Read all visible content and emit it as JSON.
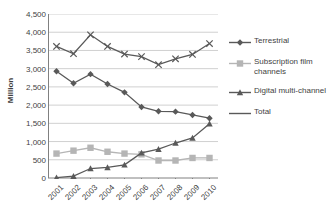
{
  "chart_data": {
    "type": "line",
    "title": "",
    "xlabel": "",
    "ylabel": "Million",
    "x": [
      "2001",
      "2002",
      "2003",
      "2004",
      "2005",
      "2006",
      "2007",
      "2008",
      "2009",
      "2010"
    ],
    "categories": [
      "2001",
      "2002",
      "2003",
      "2004",
      "2005",
      "2006",
      "2007",
      "2008",
      "2009",
      "2010"
    ],
    "ylim": [
      0,
      4500
    ],
    "ytick_values": [
      0,
      500,
      1000,
      1500,
      2000,
      2500,
      3000,
      3500,
      4000,
      4500
    ],
    "ytick_labels": [
      "0",
      "500",
      "1,000",
      "1,500",
      "2,000",
      "2,500",
      "3,000",
      "3,500",
      "4,000",
      "4,500"
    ],
    "grid": "horizontal",
    "legend_position": "right",
    "series": [
      {
        "name": "Terrestrial",
        "marker": "diamond",
        "color": "#595959",
        "values": [
          2930,
          2600,
          2850,
          2580,
          2350,
          1950,
          1830,
          1820,
          1730,
          1640
        ]
      },
      {
        "name": "Subscription film channels",
        "marker": "square",
        "color": "#b5b5b5",
        "values": [
          670,
          750,
          830,
          720,
          670,
          650,
          480,
          480,
          550,
          550
        ]
      },
      {
        "name": "Digital multi-channel",
        "marker": "triangle",
        "color": "#595959",
        "values": [
          10,
          50,
          260,
          290,
          360,
          690,
          790,
          960,
          1100,
          1490
        ]
      },
      {
        "name": "Total",
        "marker": "x",
        "color": "#595959",
        "values": [
          3610,
          3410,
          3930,
          3610,
          3400,
          3330,
          3110,
          3270,
          3390,
          3690
        ]
      }
    ]
  },
  "legend": {
    "items": [
      {
        "label": "Terrestrial",
        "marker": "diamond-marker-icon"
      },
      {
        "label": "Subscription film channels",
        "marker": "square-marker-icon"
      },
      {
        "label": "Digital multi-channel",
        "marker": "triangle-marker-icon"
      },
      {
        "label": "Total",
        "marker": "line-marker-icon"
      }
    ]
  },
  "colors": {
    "dark_series": "#595959",
    "light_series": "#b5b5b5",
    "grid": "#d0d0d0",
    "axis": "#808080",
    "text": "#3f3f3f"
  }
}
